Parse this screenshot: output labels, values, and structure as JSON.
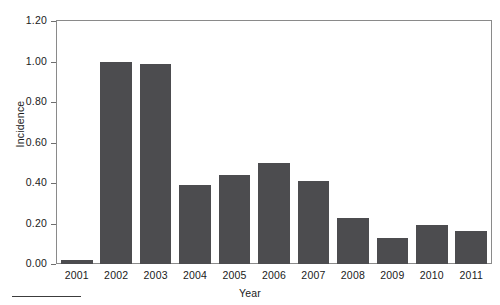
{
  "chart_data": {
    "type": "bar",
    "title": "",
    "xlabel": "Year",
    "ylabel": "Incidence",
    "categories": [
      "2001",
      "2002",
      "2003",
      "2004",
      "2005",
      "2006",
      "2007",
      "2008",
      "2009",
      "2010",
      "2011"
    ],
    "values": [
      0.02,
      1.0,
      0.99,
      0.39,
      0.44,
      0.5,
      0.41,
      0.225,
      0.13,
      0.195,
      0.165
    ],
    "ylim": [
      0.0,
      1.2
    ],
    "yticks": [
      "0.00",
      "0.20",
      "0.40",
      "0.60",
      "0.80",
      "1.00",
      "1.20"
    ],
    "ytick_values": [
      0.0,
      0.2,
      0.4,
      0.6,
      0.8,
      1.0,
      1.2
    ],
    "grid": false,
    "legend": null,
    "bar_color": "#4c4c4f",
    "frame_color": "#8a8a8a",
    "background": "#ffffff"
  },
  "figure": {
    "bottom_rule_color": "#3c3c3c"
  }
}
